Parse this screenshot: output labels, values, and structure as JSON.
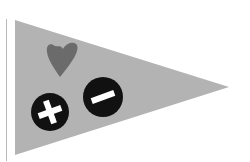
{
  "pennant": {
    "fill_color": "#b3b3b3",
    "pole_color": "#b8b8b8"
  },
  "heart": {
    "icon": "heart-icon",
    "color": "#6b6b6b"
  },
  "zoom_in": {
    "icon": "plus-icon",
    "background": "#111111",
    "glyph_color": "#ffffff"
  },
  "zoom_out": {
    "icon": "minus-icon",
    "background": "#111111",
    "glyph_color": "#ffffff"
  }
}
